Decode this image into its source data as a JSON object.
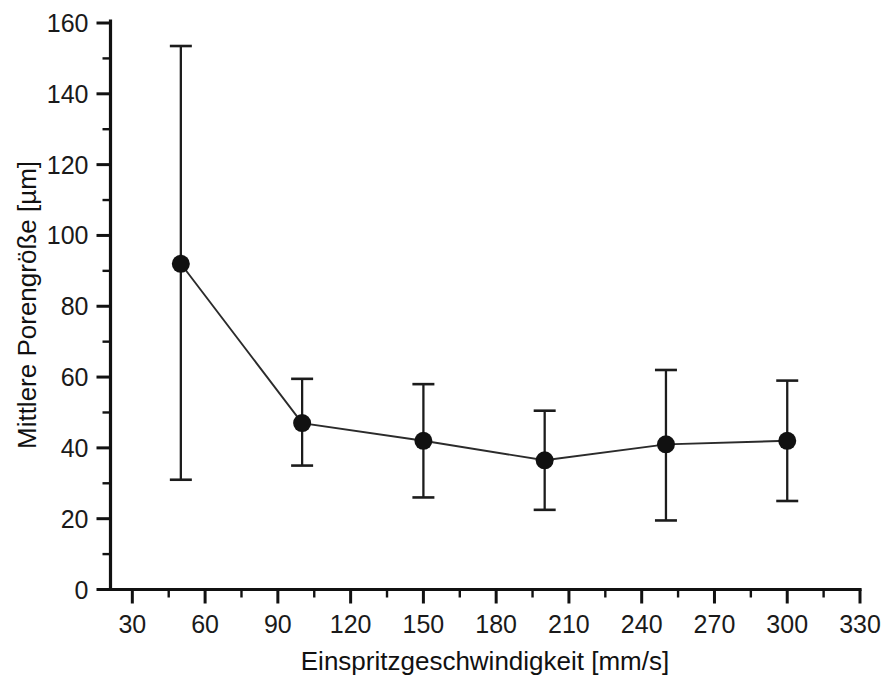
{
  "chart_data": {
    "type": "scatter",
    "title": "",
    "xlabel": "Einspritzgeschwindigkeit [mm/s]",
    "ylabel": "Mittlere Porengröße [µm]",
    "xlim": [
      21,
      330
    ],
    "ylim": [
      0,
      160
    ],
    "grid": false,
    "legend": "none",
    "line_style": "solid-connecting-line",
    "marker": "filled-circle",
    "error_bars": "symmetric-vertical-with-caps",
    "x": [
      50,
      100,
      150,
      200,
      250,
      300
    ],
    "values": [
      92,
      47,
      42,
      36.5,
      41,
      42
    ],
    "yerr_upper": [
      61.5,
      12.5,
      16,
      14,
      21,
      17
    ],
    "yerr_lower": [
      61,
      12,
      16,
      14,
      21.5,
      17
    ],
    "y_low": [
      31,
      35,
      26,
      22.5,
      19.5,
      25
    ],
    "y_high": [
      153.5,
      59.5,
      58,
      50.5,
      62,
      59
    ],
    "xticks": [
      30,
      60,
      90,
      120,
      150,
      180,
      210,
      240,
      270,
      300,
      330
    ],
    "xtick_labels": [
      "30",
      "60",
      "90",
      "120",
      "150",
      "180",
      "210",
      "240",
      "270",
      "300",
      "330"
    ],
    "xminor_step": 15,
    "yticks": [
      0,
      20,
      40,
      60,
      80,
      100,
      120,
      140,
      160
    ],
    "ytick_labels": [
      "0",
      "20",
      "40",
      "60",
      "80",
      "100",
      "120",
      "140",
      "160"
    ],
    "yminor_step": 10,
    "series": [
      {
        "name": "Mittlere Porengröße",
        "points": [
          {
            "x": 50,
            "y": 92,
            "low": 31,
            "high": 153.5
          },
          {
            "x": 100,
            "y": 47,
            "low": 35,
            "high": 59.5
          },
          {
            "x": 150,
            "y": 42,
            "low": 26,
            "high": 58
          },
          {
            "x": 200,
            "y": 36.5,
            "low": 22.5,
            "high": 50.5
          },
          {
            "x": 250,
            "y": 41,
            "low": 19.5,
            "high": 62
          },
          {
            "x": 300,
            "y": 42,
            "low": 25,
            "high": 59
          }
        ]
      }
    ]
  },
  "colors": {
    "background": "#ffffff",
    "foreground": "#111111",
    "marker": "#111111",
    "line": "#2b2b2b"
  }
}
